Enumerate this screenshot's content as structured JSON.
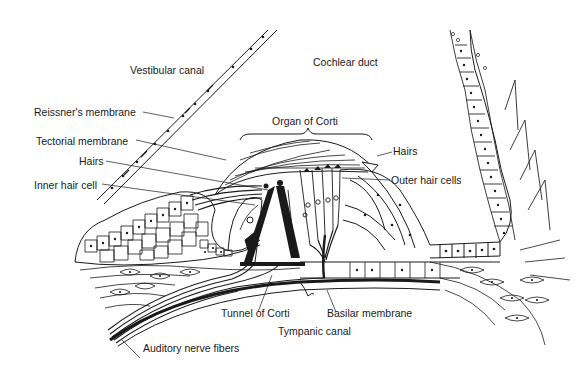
{
  "diagram": {
    "colors": {
      "ink": "#1a1a1a",
      "background": "#ffffff"
    },
    "labels": {
      "vestibular_canal": "Vestibular canal",
      "cochlear_duct": "Cochlear duct",
      "reissners_membrane": "Reissner's membrane",
      "organ_of_corti": "Organ of Corti",
      "tectorial_membrane": "Tectorial membrane",
      "hairs_left": "Hairs",
      "hairs_right": "Hairs",
      "inner_hair_cell": "Inner hair cell",
      "outer_hair_cells": "Outer hair cells",
      "tunnel_of_corti": "Tunnel of Corti",
      "basilar_membrane": "Basilar membrane",
      "tympanic_canal": "Tympanic canal",
      "auditory_nerve_fibers": "Auditory nerve fibers"
    }
  }
}
